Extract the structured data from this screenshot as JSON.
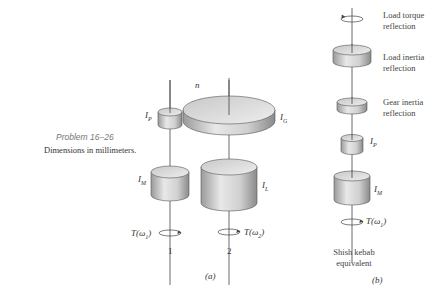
{
  "caption": {
    "problem": "Problem 16–26",
    "dimensions": "Dimensions in millimeters."
  },
  "part_a": {
    "label": "(a)",
    "speed_label": "n",
    "pinion_label": "I",
    "pinion_sub": "P",
    "gear_label": "I",
    "gear_sub": "G",
    "motor_label": "I",
    "motor_sub": "M",
    "load_label": "I",
    "load_sub": "L",
    "torque1": "T(ω",
    "torque1_sub": "1",
    "torque2": "T(ω",
    "torque2_sub": "2",
    "shaft1": "1",
    "shaft2": "2",
    "close_paren": ")"
  },
  "part_b": {
    "label": "(b)",
    "load_torque_line1": "Load torque",
    "load_torque_line2": "reflection",
    "load_inertia_line1": "Load inertia",
    "load_inertia_line2": "reflection",
    "gear_inertia_line1": "Gear inertia",
    "gear_inertia_line2": "reflection",
    "pinion_label": "I",
    "pinion_sub": "P",
    "motor_label": "I",
    "motor_sub": "M",
    "torque": "T(ω",
    "torque_sub": "1",
    "close_paren": ")",
    "equiv_line1": "Shish kebab",
    "equiv_line2": "equivalent"
  }
}
